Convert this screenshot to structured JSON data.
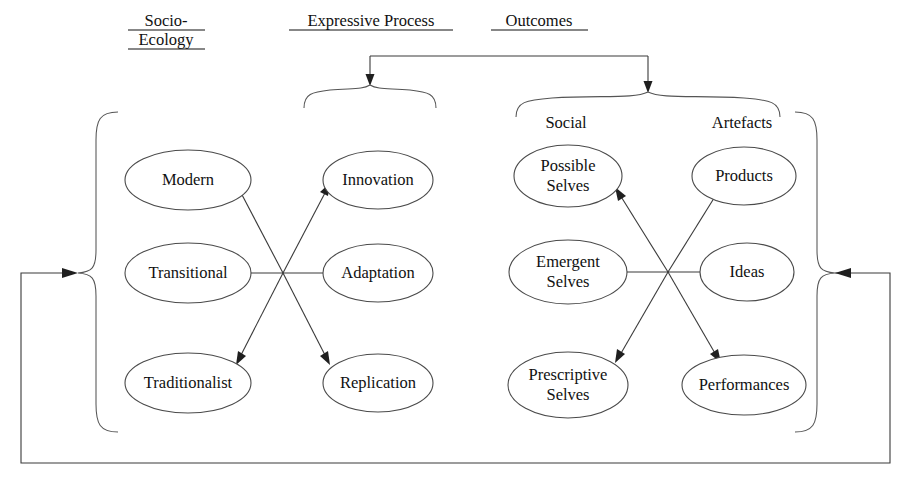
{
  "diagram": {
    "background_color": "#ffffff",
    "line_color": "#3a3a3a",
    "text_color": "#111111",
    "headers": [
      {
        "id": "socio-ecology",
        "lines": [
          "Socio-",
          "Ecology"
        ],
        "underlined": true
      },
      {
        "id": "expressive-process",
        "lines": [
          "Expressive Process"
        ],
        "underlined": true
      },
      {
        "id": "outcomes",
        "lines": [
          "Outcomes"
        ],
        "underlined": true
      }
    ],
    "subheaders": [
      {
        "id": "social",
        "label": "Social"
      },
      {
        "id": "artefacts",
        "label": "Artefacts"
      }
    ],
    "columns": [
      {
        "id": "socio-ecology-column",
        "header_ref": "socio-ecology",
        "nodes": [
          {
            "id": "modern",
            "lines": [
              "Modern"
            ]
          },
          {
            "id": "transitional",
            "lines": [
              "Transitional"
            ]
          },
          {
            "id": "traditionalist",
            "lines": [
              "Traditionalist"
            ]
          }
        ]
      },
      {
        "id": "expressive-process-column",
        "header_ref": "expressive-process",
        "nodes": [
          {
            "id": "innovation",
            "lines": [
              "Innovation"
            ]
          },
          {
            "id": "adaptation",
            "lines": [
              "Adaptation"
            ]
          },
          {
            "id": "replication",
            "lines": [
              "Replication"
            ]
          }
        ]
      },
      {
        "id": "social-column",
        "header_ref": "social",
        "nodes": [
          {
            "id": "possible-selves",
            "lines": [
              "Possible",
              "Selves"
            ]
          },
          {
            "id": "emergent-selves",
            "lines": [
              "Emergent",
              "Selves"
            ]
          },
          {
            "id": "prescriptive-selves",
            "lines": [
              "Prescriptive",
              "Selves"
            ]
          }
        ]
      },
      {
        "id": "artefacts-column",
        "header_ref": "artefacts",
        "nodes": [
          {
            "id": "products",
            "lines": [
              "Products"
            ]
          },
          {
            "id": "ideas",
            "lines": [
              "Ideas"
            ]
          },
          {
            "id": "performances",
            "lines": [
              "Performances"
            ]
          }
        ]
      }
    ],
    "connections": {
      "left_cluster": {
        "description": "six-way crossing between Socio-Ecology and Expressive Process columns",
        "targets": [
          "modern",
          "transitional",
          "traditionalist",
          "innovation",
          "adaptation",
          "replication"
        ]
      },
      "right_cluster": {
        "description": "six-way crossing between Social and Artefacts columns",
        "targets": [
          "possible-selves",
          "emergent-selves",
          "prescriptive-selves",
          "products",
          "ideas",
          "performances"
        ]
      },
      "top_connector": {
        "description": "horizontal bar feeding arrows down into the Expressive Process and Outcomes braces"
      },
      "feedback_loop": {
        "description": "outer loop from the Outcomes bracket around the bottom back into the Socio-Ecology bracket"
      }
    }
  }
}
